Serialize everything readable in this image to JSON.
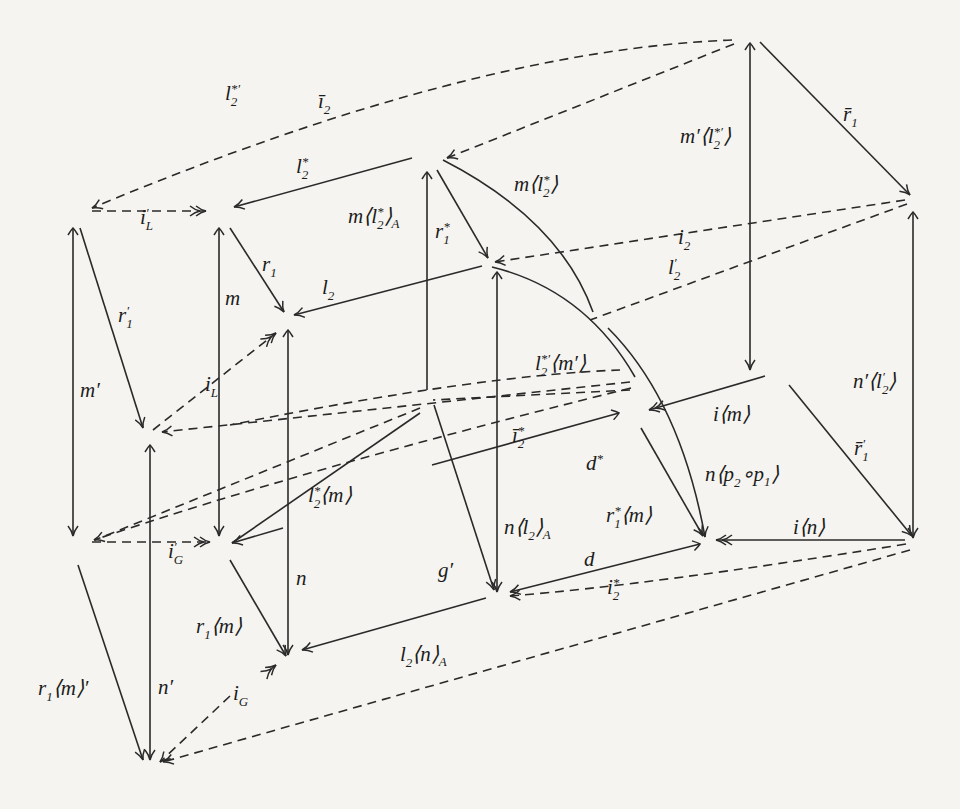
{
  "diagram": {
    "type": "commutative-diagram",
    "background_color": "#f5f4f0",
    "ink_color": "#2a2a2a",
    "nodes": [
      "A",
      "B",
      "C",
      "D",
      "E",
      "F",
      "G",
      "H",
      "I",
      "J",
      "L",
      "M",
      "N",
      "O",
      "P",
      "Q",
      "R"
    ],
    "edges": [
      {
        "id": "l2star-prime",
        "from": "A",
        "to": "B",
        "style": "dashed",
        "label": "l₂*′"
      },
      {
        "id": "i2-bar",
        "from": "A",
        "to": "D",
        "style": "dashed",
        "label": "ī₂"
      },
      {
        "id": "i-L-prime",
        "from": "B",
        "to": "C",
        "style": "dashed",
        "label": "i′_L",
        "head": "double"
      },
      {
        "id": "l2star",
        "from": "D",
        "to": "C",
        "style": "solid",
        "label": "l₂*"
      },
      {
        "id": "m-l2star-A",
        "from": "D",
        "to": "Q",
        "style": "solid",
        "label": "m⟨l₂*⟩_A",
        "tail": "mono"
      },
      {
        "id": "r1star",
        "from": "D",
        "to": "E",
        "style": "solid",
        "label": "r₁*"
      },
      {
        "id": "m-l2star",
        "from": "D",
        "to": "N",
        "style": "solid",
        "curved": true,
        "label": "m⟨l₂*⟩"
      },
      {
        "id": "m-prime-l2star-prime",
        "from": "A",
        "to": "I",
        "style": "solid",
        "label": "m′⟨l₂*′⟩",
        "tail": "mono"
      },
      {
        "id": "r1-bar",
        "from": "A",
        "to": "F",
        "style": "solid",
        "label": "r̄₁"
      },
      {
        "id": "i2",
        "from": "F",
        "to": "E",
        "style": "dashed",
        "label": "i₂"
      },
      {
        "id": "l2-prime",
        "from": "F",
        "to": "J",
        "style": "dashed",
        "label": "l′₂"
      },
      {
        "id": "r1-prime",
        "from": "B",
        "to": "H",
        "style": "solid",
        "label": "r′₁"
      },
      {
        "id": "m-prime",
        "from": "B",
        "to": "L",
        "style": "solid",
        "label": "m′",
        "tail": "mono"
      },
      {
        "id": "m",
        "from": "C",
        "to": "M",
        "style": "solid",
        "label": "m",
        "tail": "mono"
      },
      {
        "id": "r1",
        "from": "C",
        "to": "G",
        "style": "solid",
        "label": "r₁"
      },
      {
        "id": "l2",
        "from": "E",
        "to": "G",
        "style": "solid",
        "label": "l₂"
      },
      {
        "id": "i-L",
        "from": "H",
        "to": "G",
        "style": "dashed",
        "label": "i_L",
        "head": "double"
      },
      {
        "id": "n-l2-A",
        "from": "E",
        "to": "Q",
        "style": "solid",
        "label": "n⟨l₂⟩_A",
        "tail": "mono"
      },
      {
        "id": "l2star-prime-m-prime",
        "from": "E",
        "to": "J",
        "style": "solid",
        "curved": true,
        "label": "l₂*′⟨m′⟩"
      },
      {
        "id": "i-m",
        "from": "I",
        "to": "J",
        "style": "solid",
        "label": "i⟨m⟩",
        "head": "double"
      },
      {
        "id": "n-prime-l2-prime",
        "from": "F",
        "to": "O",
        "style": "solid",
        "label": "n′⟨l′₂⟩",
        "tail": "mono"
      },
      {
        "id": "r1-bar-prime",
        "from": "I",
        "to": "O",
        "style": "solid",
        "label": "r̄′₁"
      },
      {
        "id": "i2star-bar",
        "from": "I",
        "to": "K",
        "style": "dashed",
        "label": "ī₂*"
      },
      {
        "id": "d-star",
        "from": "J",
        "to": "K",
        "style": "solid",
        "label": "d*",
        "tail": "mono"
      },
      {
        "id": "n-p2-p1",
        "from": "E",
        "to": "N",
        "style": "solid",
        "curved": true,
        "label": "n⟨p₂∘p₁⟩"
      },
      {
        "id": "i-n",
        "from": "O",
        "to": "N",
        "style": "solid",
        "label": "i⟨n⟩",
        "head": "double"
      },
      {
        "id": "r1star-m",
        "from": "J",
        "to": "N",
        "style": "solid",
        "label": "r₁*⟨m⟩"
      },
      {
        "id": "l2star-m",
        "from": "K",
        "to": "M",
        "style": "solid",
        "label": "l₂*⟨m⟩"
      },
      {
        "id": "i-G-prime",
        "from": "L",
        "to": "M",
        "style": "dashed",
        "label": "i′_G",
        "head": "double"
      },
      {
        "id": "g-prime",
        "from": "K",
        "to": "Q",
        "style": "solid",
        "label": "g′"
      },
      {
        "id": "d",
        "from": "N",
        "to": "Q",
        "style": "solid",
        "label": "d",
        "tail": "mono"
      },
      {
        "id": "i2star",
        "from": "O",
        "to": "Q",
        "style": "dashed",
        "label": "i₂*"
      },
      {
        "id": "n",
        "from": "G",
        "to": "P",
        "style": "solid",
        "label": "n",
        "tail": "mono"
      },
      {
        "id": "r1-m",
        "from": "M",
        "to": "P",
        "style": "solid",
        "label": "r₁⟨m⟩"
      },
      {
        "id": "l2-n-A",
        "from": "Q",
        "to": "P",
        "style": "solid",
        "label": "l₂⟨n⟩_A"
      },
      {
        "id": "r1-m-prime",
        "from": "L",
        "to": "R",
        "style": "solid",
        "label": "r₁⟨m⟩′"
      },
      {
        "id": "n-prime",
        "from": "H",
        "to": "R",
        "style": "solid",
        "label": "n′",
        "tail": "mono"
      },
      {
        "id": "i-G",
        "from": "P",
        "to": "R",
        "style": "dashed",
        "label": "i_G",
        "head": "double"
      },
      {
        "id": "l2-prime-n-prime",
        "from": "O",
        "to": "R",
        "style": "dashed",
        "label": "l′₂⟨n′⟩"
      },
      {
        "id": "dashed-H-from-right",
        "from": "J",
        "to": "H",
        "style": "dashed",
        "label": ""
      },
      {
        "id": "dashed-L-from-right",
        "from": "I",
        "to": "L",
        "style": "dashed",
        "label": ""
      }
    ],
    "labels": {
      "l2star_prime": {
        "base": "l",
        "sub": "2",
        "sup": "*′"
      },
      "i2_bar": {
        "base": "ī",
        "sub": "2"
      },
      "r1_bar": {
        "base": "r̄",
        "sub": "1"
      },
      "m_prime_l2star_prime": {
        "pre": "m′⟨",
        "base": "l",
        "sub": "2",
        "sup": "*′",
        "post": "⟩"
      },
      "l2star": {
        "base": "l",
        "sub": "2",
        "sup": "*"
      },
      "i_L_prime": {
        "base": "i",
        "sub": "L",
        "sup": "′"
      },
      "m_l2star_A": {
        "pre": "m⟨",
        "base": "l",
        "sub": "2",
        "sup": "*",
        "post": "⟩",
        "post_sub": "A"
      },
      "m_l2star": {
        "pre": "m⟨",
        "base": "l",
        "sub": "2",
        "sup": "*",
        "post": "⟩"
      },
      "r1star": {
        "base": "r",
        "sub": "1",
        "sup": "*"
      },
      "r1": {
        "base": "r",
        "sub": "1"
      },
      "i2": {
        "base": "i",
        "sub": "2"
      },
      "l2": {
        "base": "l",
        "sub": "2"
      },
      "l2_prime": {
        "base": "l",
        "sub": "2",
        "sup": "′"
      },
      "r1_prime": {
        "base": "r",
        "sub": "1",
        "sup": "′"
      },
      "m": {
        "base": "m"
      },
      "m_prime": {
        "base": "m′"
      },
      "i_L": {
        "base": "i",
        "sub": "L"
      },
      "l2star_prime_m_prime": {
        "base": "l",
        "sub": "2",
        "sup": "*′",
        "post": "⟨m′⟩"
      },
      "n_prime_l2_prime": {
        "pre": "n′⟨",
        "base": "l",
        "sub": "2",
        "sup": "′",
        "post": "⟩"
      },
      "i_m": {
        "base": "i⟨m⟩"
      },
      "i2star_bar": {
        "base": "ī",
        "sub": "2",
        "sup": "*"
      },
      "r1_bar_prime": {
        "base": "r̄",
        "sub": "1",
        "sup": "′"
      },
      "d_star": {
        "base": "d",
        "sup": "*"
      },
      "n_p2_p1": {
        "pre": "n⟨",
        "base": "p",
        "sub": "2",
        "mid": "∘p",
        "sub2": "1",
        "post": "⟩"
      },
      "l2star_m": {
        "base": "l",
        "sub": "2",
        "sup": "*",
        "post": "⟨m⟩"
      },
      "i_G_prime": {
        "base": "i",
        "sub": "G",
        "sup": "′"
      },
      "n_l2_A": {
        "pre": "n⟨",
        "base": "l",
        "sub": "2",
        "post": "⟩",
        "post_sub": "A"
      },
      "r1star_m": {
        "base": "r",
        "sub": "1",
        "sup": "*",
        "post": "⟨m⟩"
      },
      "i_n": {
        "base": "i⟨n⟩"
      },
      "n": {
        "base": "n"
      },
      "g_prime": {
        "base": "g′"
      },
      "d": {
        "base": "d"
      },
      "i2star": {
        "base": "i",
        "sub": "2",
        "sup": "*"
      },
      "r1_m": {
        "base": "r",
        "sub": "1",
        "post": "⟨m⟩"
      },
      "l2_n_A": {
        "base": "l",
        "sub": "2",
        "post": "⟨n⟩",
        "post_sub": "A"
      },
      "r1_m_prime": {
        "base": "r",
        "sub": "1",
        "post": "⟨m⟩′"
      },
      "n_prime": {
        "base": "n′"
      },
      "i_G": {
        "base": "i",
        "sub": "G"
      }
    }
  }
}
